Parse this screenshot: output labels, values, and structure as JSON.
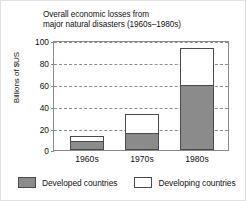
{
  "chart_data": {
    "type": "bar",
    "subtype": "stacked-bar",
    "title": "Overall economic losses from\nmajor natural disasters (1960s–1980s)",
    "xlabel": "",
    "ylabel": "Billions of $US",
    "categories": [
      "1960s",
      "1970s",
      "1980s"
    ],
    "series": [
      {
        "name": "Developed countries",
        "color": "#8b8b8b",
        "values": [
          8,
          16,
          60
        ]
      },
      {
        "name": "Developing countries",
        "color": "#ffffff",
        "values": [
          5,
          17,
          34
        ]
      }
    ],
    "totals": [
      13,
      33,
      94
    ],
    "ylim": [
      0,
      100
    ],
    "yticks": [
      "0",
      "20",
      "40",
      "60",
      "80",
      "100"
    ],
    "ytick_values": [
      0,
      20,
      40,
      60,
      80,
      100
    ],
    "grid": "horizontal-dashed",
    "legend_position": "bottom"
  },
  "axis": {
    "y_title": "Billions of $US",
    "tick_labels": [
      "100",
      "80",
      "60",
      "40",
      "20",
      "0"
    ]
  },
  "legend": {
    "items": [
      {
        "label": "Developed countries",
        "swatch": "gray-filled-square"
      },
      {
        "label": "Developing countries",
        "swatch": "white-outlined-square"
      }
    ]
  }
}
